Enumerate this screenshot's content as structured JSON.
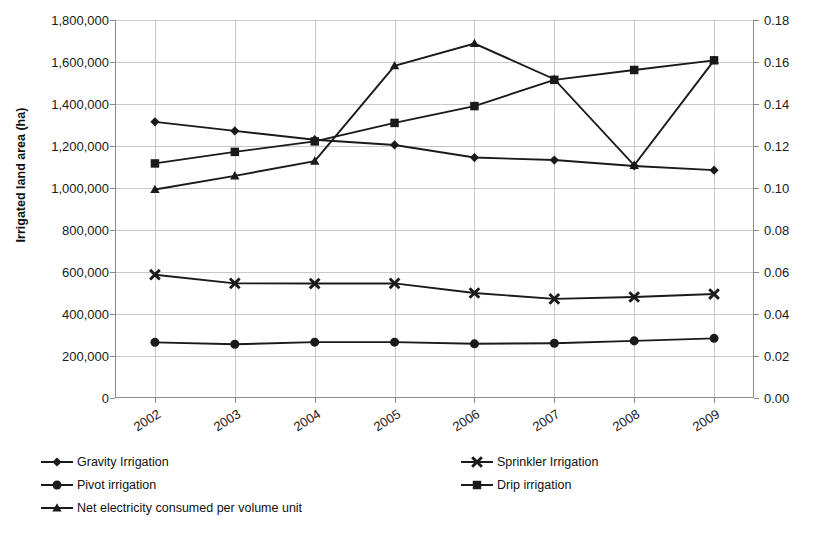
{
  "chart_data": {
    "type": "line",
    "title": "",
    "xlabel": "",
    "ylabel": "Irrigated land area (ha)",
    "y2label": "Net electricity consumed per volume unit (kWh/m³)",
    "categories": [
      "2002",
      "2003",
      "2004",
      "2005",
      "2006",
      "2007",
      "2008",
      "2009"
    ],
    "ylim": [
      0,
      1800000
    ],
    "y2lim": [
      0.0,
      0.18
    ],
    "yticks": [
      "0",
      "200,000",
      "400,000",
      "600,000",
      "800,000",
      "1,000,000",
      "1,200,000",
      "1,400,000",
      "1,600,000",
      "1,800,000"
    ],
    "ytick_values": [
      0,
      200000,
      400000,
      600000,
      800000,
      1000000,
      1200000,
      1400000,
      1600000,
      1800000
    ],
    "y2ticks": [
      "0.00",
      "0.02",
      "0.04",
      "0.06",
      "0.08",
      "0.10",
      "0.12",
      "0.14",
      "0.16",
      "0.18"
    ],
    "y2tick_values": [
      0.0,
      0.02,
      0.04,
      0.06,
      0.08,
      0.1,
      0.12,
      0.14,
      0.16,
      0.18
    ],
    "grid": true,
    "legend_position": "bottom",
    "series": [
      {
        "name": "Gravity Irrigation",
        "marker": "diamond",
        "axis": "left",
        "values": [
          1315000,
          1272000,
          1230000,
          1205000,
          1145000,
          1133000,
          1105000,
          1085000
        ]
      },
      {
        "name": "Sprinkler Irrigation",
        "marker": "x",
        "axis": "left",
        "values": [
          587000,
          546000,
          545000,
          546000,
          500000,
          472000,
          481000,
          495000
        ]
      },
      {
        "name": "Pivot irrigation",
        "marker": "circle",
        "axis": "left",
        "values": [
          265000,
          256000,
          266000,
          266000,
          258000,
          261000,
          272000,
          284000
        ]
      },
      {
        "name": "Drip irrigation",
        "marker": "square",
        "axis": "left",
        "values": [
          1117000,
          1172000,
          1222000,
          1310000,
          1390000,
          1515000,
          1562000,
          1608000
        ]
      },
      {
        "name": "Net electricity consumed per volume unit",
        "marker": "triangle",
        "axis": "right",
        "values": [
          0.0993,
          0.1058,
          0.1128,
          0.1582,
          0.1688,
          0.1518,
          0.1108,
          0.1608
        ]
      }
    ]
  },
  "legend": {
    "items": [
      {
        "label": "Gravity Irrigation",
        "marker": "diamond"
      },
      {
        "label": "Sprinkler Irrigation",
        "marker": "x"
      },
      {
        "label": "Pivot irrigation",
        "marker": "circle"
      },
      {
        "label": "Drip irrigation",
        "marker": "square"
      },
      {
        "label": "Net electricity consumed per volume unit",
        "marker": "triangle"
      }
    ]
  },
  "colors": {
    "series": "#1a1a1a",
    "grid": "#c8c8c8",
    "axis": "#8a8a8a",
    "text": "#1a1a1a"
  },
  "caption": ""
}
